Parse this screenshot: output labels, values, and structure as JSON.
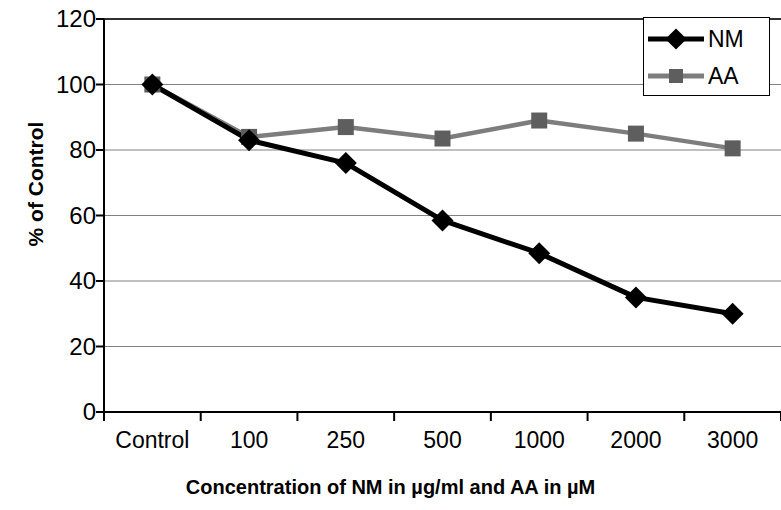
{
  "chart_data": {
    "type": "line",
    "title": "",
    "xlabel": "Concentration of NM in µg/ml and AA in µM",
    "ylabel": "% of Control",
    "categories": [
      "Control",
      "100",
      "250",
      "500",
      "1000",
      "2000",
      "3000"
    ],
    "ylim": [
      0,
      120
    ],
    "ytick_step": 20,
    "yticks": [
      "0",
      "20",
      "40",
      "60",
      "80",
      "100",
      "120"
    ],
    "grid": "horizontal",
    "legend_position": "top-right",
    "series": [
      {
        "name": "NM",
        "color": "#000000",
        "marker": "diamond",
        "values": [
          100,
          83,
          76,
          58.5,
          48.5,
          35,
          30
        ]
      },
      {
        "name": "AA",
        "color": "#7d7d7d",
        "marker": "square",
        "values": [
          100,
          84,
          87,
          83.5,
          89,
          85,
          80.5
        ]
      }
    ]
  },
  "legend": {
    "items": [
      {
        "label": "NM"
      },
      {
        "label": "AA"
      }
    ]
  },
  "colors": {
    "nm_line": "#000000",
    "aa_line": "#7d7d7d",
    "aa_marker": "#5e5e5e",
    "axis": "#000000",
    "gridline": "#808080",
    "background": "#ffffff"
  }
}
